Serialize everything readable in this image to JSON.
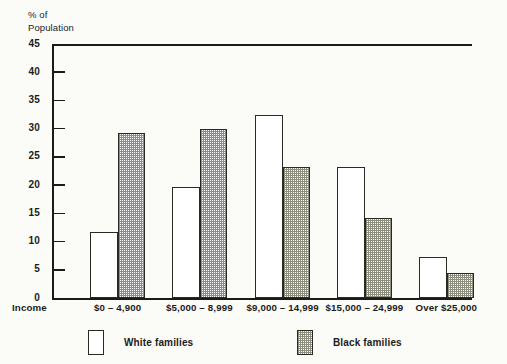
{
  "chart_data": {
    "type": "bar",
    "title": "",
    "subtitle": "",
    "ylabel": "% of\nPopulation",
    "xlabel": "Income",
    "categories": [
      "$0 – 4,900",
      "$5,000 – 8,999",
      "$9,000 – 14,999",
      "$15,000 – 24,999",
      "Over $25,000"
    ],
    "series": [
      {
        "name": "White families",
        "values": [
          11.7,
          19.7,
          32.5,
          23.3,
          7.3
        ],
        "fill": "white"
      },
      {
        "name": "Black families",
        "values": [
          29.3,
          30.0,
          23.3,
          14.1,
          4.4
        ],
        "fill": "dotted"
      }
    ],
    "ylim": [
      0,
      45
    ],
    "yticks": [
      0,
      5,
      10,
      15,
      20,
      25,
      30,
      35,
      40,
      45
    ],
    "ytick_labels": [
      "0",
      "5",
      "10",
      "15",
      "20",
      "25",
      "30",
      "35",
      "40",
      "45"
    ],
    "grid": false,
    "legend_position": "bottom"
  },
  "axes": {
    "y_title": "% of\nPopulation",
    "x_title": "Income"
  },
  "legend": {
    "entries": [
      {
        "label": "White families",
        "swatch": "white-swatch"
      },
      {
        "label": "Black families",
        "swatch": "dotted-swatch"
      }
    ]
  },
  "colors": {
    "ink": "#1b1b1b",
    "paper": "#fbfbf7",
    "bar_outline": "#2a2a22",
    "dotted_fill": "#8d8d7e"
  }
}
